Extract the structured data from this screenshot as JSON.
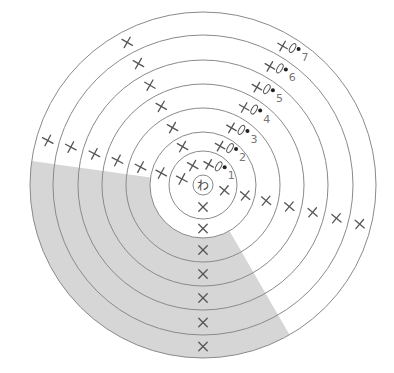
{
  "diagram": {
    "type": "crochet-circle-chart",
    "center": {
      "x": 203,
      "y": 185
    },
    "magic_ring": {
      "label": "わ",
      "radius": 10
    },
    "round_radii": [
      34,
      53,
      77,
      101,
      125,
      150,
      173
    ],
    "shading": {
      "color": "#d6d6d6",
      "start_angle_deg": 191,
      "end_angle_deg": 57,
      "inner_radius": 34,
      "note": "shaded segment from left side, sweeping through bottom, to lower right"
    },
    "rounds": [
      {
        "number": "1",
        "label": "1"
      },
      {
        "number": "2",
        "label": "2"
      },
      {
        "number": "3",
        "label": "3"
      },
      {
        "number": "4",
        "label": "4"
      },
      {
        "number": "5",
        "label": "5"
      },
      {
        "number": "6",
        "label": "6"
      },
      {
        "number": "7",
        "label": "7"
      }
    ],
    "symbols": {
      "single_crochet": "×",
      "chain": "0",
      "slip_stitch": "•"
    }
  }
}
